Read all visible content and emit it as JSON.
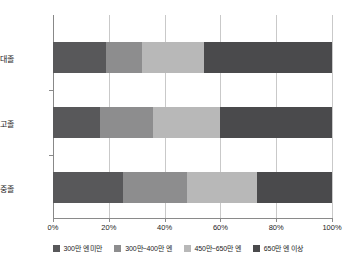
{
  "chart_data": {
    "type": "bar",
    "orientation": "horizontal",
    "stacked": true,
    "stacked_mode": "percent",
    "title": "",
    "subtitle": "",
    "xlabel": "",
    "ylabel": "",
    "xlim": [
      0,
      100
    ],
    "xticks": [
      0,
      20,
      40,
      60,
      80,
      100
    ],
    "xticklabels": [
      "0%",
      "20%",
      "40%",
      "60%",
      "80%",
      "100%"
    ],
    "grid": true,
    "grid_axis": "x",
    "legend_position": "bottom",
    "categories": [
      "父・대졸",
      "父・고졸",
      "父・중졸"
    ],
    "series": [
      {
        "name": "300만 엔 미만",
        "color": "#58585a",
        "values": [
          19,
          17,
          25
        ]
      },
      {
        "name": "300만~400만 엔",
        "color": "#8d8d8e",
        "values": [
          13,
          19,
          23
        ]
      },
      {
        "name": "450만~650만 엔",
        "color": "#b8b8b8",
        "values": [
          22,
          24,
          25
        ]
      },
      {
        "name": "650만 엔 이상",
        "color": "#4a4a4c",
        "values": [
          46,
          40,
          27
        ]
      }
    ]
  },
  "axis": {
    "tick_labels": [
      "0%",
      "20%",
      "40%",
      "60%",
      "80%",
      "100%"
    ]
  },
  "categories": {
    "items": [
      {
        "label": "父・대졸"
      },
      {
        "label": "父・고졸"
      },
      {
        "label": "父・중졸"
      }
    ]
  },
  "legend": {
    "items": [
      {
        "label": "300만 엔 미만",
        "color": "#58585a"
      },
      {
        "label": "300만~400만 엔",
        "color": "#8d8d8e"
      },
      {
        "label": "450만~650만 엔",
        "color": "#b8b8b8"
      },
      {
        "label": "650만 엔 이상",
        "color": "#4a4a4c"
      }
    ]
  }
}
